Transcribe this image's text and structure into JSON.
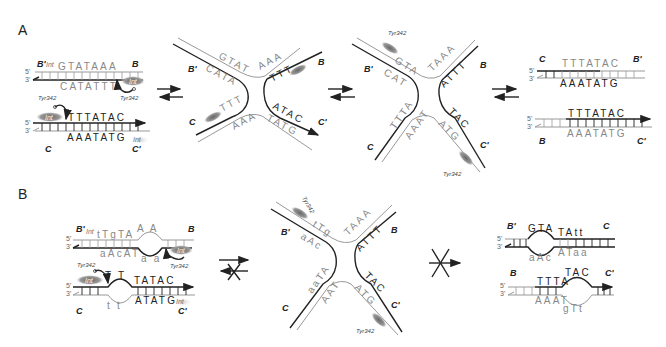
{
  "panels": {
    "A": {
      "label": "A",
      "left_duplexes": {
        "top": {
          "left_site": "B'",
          "right_site": "B",
          "top_seq": "GTATAAA",
          "bottom_seq": "CATATTT",
          "int_top": "Int",
          "int_bottom": "Int",
          "tyr": "Tyr342",
          "end5": "5'",
          "end3": "3'"
        },
        "bottom": {
          "left_site": "C",
          "right_site": "C'",
          "top_seq": "TTTATAC",
          "bottom_seq": "AAATATG",
          "int_top": "Int",
          "int_bottom": "Int",
          "tyr": "Tyr342",
          "end5": "5'",
          "end3": "3'"
        }
      },
      "junction1": {
        "sites": [
          "B'",
          "B",
          "C",
          "C'"
        ],
        "labels": [
          "GTAT",
          "CATA",
          "AAA",
          "TTT",
          "TTT",
          "AAA",
          "ATAC",
          "TATG"
        ],
        "int": "Int"
      },
      "junction2": {
        "sites": [
          "B'",
          "B",
          "C",
          "C'"
        ],
        "labels": [
          "GTA",
          "CAT",
          "TAAA",
          "ATTT",
          "TTTA",
          "AAAT",
          "TAC",
          "ATG"
        ],
        "tyr": "Tyr342",
        "int": "Int"
      },
      "right_duplexes": {
        "top": {
          "left_site": "C",
          "right_site": "B'",
          "top_seq": "TTTATAC",
          "bottom_seq": "AAATATG",
          "end5": "5'",
          "end3": "3'"
        },
        "bottom": {
          "left_site": "B",
          "right_site": "C'",
          "top_seq": "TTTATAC",
          "bottom_seq": "AAATATG",
          "end5": "5'",
          "end3": "3'"
        }
      }
    },
    "B": {
      "label": "B",
      "left_duplexes": {
        "top": {
          "left_site": "B'",
          "right_site": "B",
          "top_seq": "tTgTA",
          "loop_top": "A   A",
          "bottom_seq": "aAcAT",
          "loop_bottom": "a   a",
          "int_top": "Int",
          "int_bottom": "Int",
          "tyr_left": "Tyr342",
          "tyr_right": "Tyr342",
          "end5": "5'",
          "end3": "3'"
        },
        "bottom": {
          "left_site": "C",
          "right_site": "C'",
          "loop_top": "T   T",
          "top_seq": "TATAC",
          "loop_bottom": "t   t",
          "bottom_seq": "ATATG",
          "int_top": "Int",
          "int_bottom": "Int",
          "end5": "5'",
          "end3": "3'"
        }
      },
      "junction": {
        "sites": [
          "B'",
          "B",
          "C",
          "C'"
        ],
        "labels": [
          "tTg",
          "aAc",
          "TAAA",
          "ATTT",
          "aaTA",
          "AAT",
          "TAC",
          "ATG"
        ],
        "tyr": "Tyr342",
        "int": "Int"
      },
      "right_duplexes": {
        "top": {
          "left_site": "B'",
          "right_site": "C",
          "loop": "GTA",
          "loop_bottom": "aAc",
          "top_seq": "TAtt",
          "bottom_seq": "ATaa",
          "end5": "5'",
          "end3": "3'"
        },
        "bottom": {
          "left_site": "B",
          "right_site": "C'",
          "top_seq": "TTTA",
          "loop": "TAC",
          "bottom_seq": "AAAT",
          "loop_bottom": "gTt",
          "end5": "5'",
          "end3": "3'"
        }
      }
    }
  },
  "arrows": {
    "A": [
      "equilibrium",
      "equilibrium",
      "equilibrium"
    ],
    "B": [
      "blocked-equilibrium",
      "blocked-forward"
    ]
  }
}
